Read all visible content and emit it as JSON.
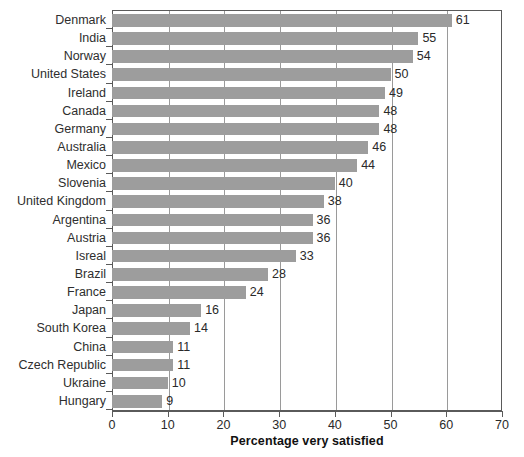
{
  "chart_data": {
    "type": "bar",
    "orientation": "horizontal",
    "title": "",
    "xlabel": "Percentage very satisfied",
    "ylabel": "",
    "xlim": [
      0,
      70
    ],
    "ylim": null,
    "grid": true,
    "legend": null,
    "xticks": [
      0,
      10,
      20,
      30,
      40,
      50,
      60,
      70
    ],
    "xtick_labels": [
      "0",
      "10",
      "20",
      "30",
      "40",
      "50",
      "60",
      "70"
    ],
    "categories": [
      "Denmark",
      "India",
      "Norway",
      "United States",
      "Ireland",
      "Canada",
      "Germany",
      "Australia",
      "Mexico",
      "Slovenia",
      "United Kingdom",
      "Argentina",
      "Austria",
      "Isreal",
      "Brazil",
      "France",
      "Japan",
      "South Korea",
      "China",
      "Czech Republic",
      "Ukraine",
      "Hungary"
    ],
    "values": [
      61,
      55,
      54,
      50,
      49,
      48,
      48,
      46,
      44,
      40,
      38,
      36,
      36,
      33,
      28,
      24,
      16,
      14,
      11,
      11,
      10,
      9
    ],
    "value_labels": [
      "61",
      "55",
      "54",
      "50",
      "49",
      "48",
      "48",
      "46",
      "44",
      "40",
      "38",
      "36",
      "36",
      "33",
      "28",
      "24",
      "16",
      "14",
      "11",
      "11",
      "10",
      "9"
    ],
    "bar_color": "#9d9d9d",
    "axis_color": "#5a5a5a",
    "grid_color": "#9a9a9a",
    "background_color": "#ffffff"
  }
}
